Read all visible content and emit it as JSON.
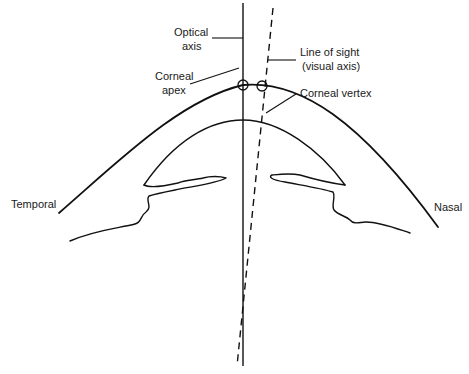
{
  "diagram": {
    "labels": {
      "optical_axis_line1": "Optical",
      "optical_axis_line2": "axis",
      "line_of_sight_line1": "Line of sight",
      "line_of_sight_line2": "(visual axis)",
      "corneal_apex_line1": "Corneal",
      "corneal_apex_line2": "apex",
      "corneal_vertex": "Corneal vertex",
      "temporal": "Temporal",
      "nasal": "Nasal"
    },
    "colors": {
      "stroke": "#111111",
      "background": "#ffffff",
      "text": "#1a1a1a"
    }
  }
}
